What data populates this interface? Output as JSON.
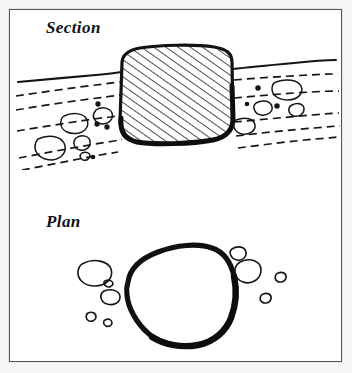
{
  "figure": {
    "type": "archaeological-illustration",
    "medium": "line-drawing",
    "background_color": "#f6f6f4",
    "paper_color": "#ffffff",
    "ink_color": "#101014",
    "frame": {
      "border_color": "#55565a",
      "border_width_px": 1
    }
  },
  "panels": [
    {
      "id": "section",
      "label": "Section",
      "description": "Cross-section through a deposit showing a large hatched boulder set into the ground surface, with dashed bedding lines and small clasts either side.",
      "elements": {
        "ground_surface_line": "solid",
        "bedding_lines": "dashed",
        "boulder_fill": "diagonal-hatch",
        "boulder_outline": "heavy"
      }
    },
    {
      "id": "plan",
      "label": "Plan",
      "description": "Plan view of the same boulder as a thick irregular closed outline, surrounded by smaller outlined stones and dots.",
      "elements": {
        "boulder_outline": "heavy",
        "surrounding_clasts": "thin-outline"
      }
    }
  ],
  "labels": {
    "section": "Section",
    "plan": "Plan"
  }
}
